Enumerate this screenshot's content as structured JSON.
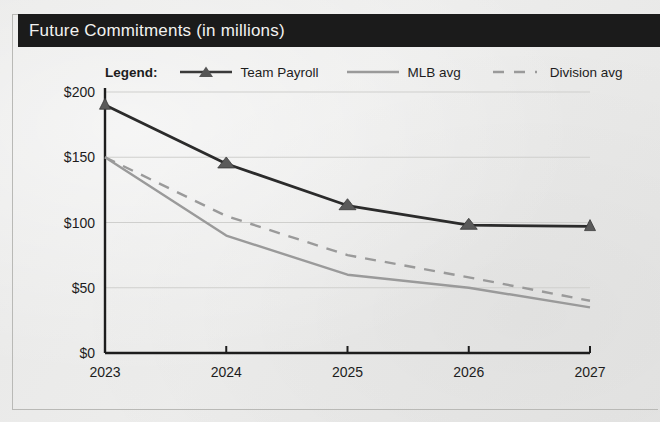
{
  "figure": {
    "title": "Future Commitments (in millions)",
    "title_bar_color": "#1b1b1b",
    "background_color": "#ececeb"
  },
  "legend": {
    "title": "Legend:",
    "entries": [
      {
        "label": "Team Payroll",
        "style": "line-with-triangle-marker",
        "color": "#2b2b2b"
      },
      {
        "label": "MLB avg",
        "style": "solid-line",
        "color": "#9a9a9a"
      },
      {
        "label": "Division avg",
        "style": "dashed-line",
        "color": "#9a9a9a"
      }
    ]
  },
  "axes": {
    "y_tick_labels": [
      "$0",
      "$50",
      "$100",
      "$150",
      "$200"
    ],
    "x_tick_labels": [
      "2023",
      "2024",
      "2025",
      "2026",
      "2027"
    ]
  },
  "chart_data": {
    "type": "line",
    "title": "Future Commitments (in millions)",
    "xlabel": "",
    "ylabel": "",
    "categories": [
      "2023",
      "2024",
      "2025",
      "2026",
      "2027"
    ],
    "x": [
      2023,
      2024,
      2025,
      2026,
      2027
    ],
    "ylim": [
      0,
      200
    ],
    "yticks": [
      0,
      50,
      100,
      150,
      200
    ],
    "ytick_labels": [
      "$0",
      "$50",
      "$100",
      "$150",
      "$200"
    ],
    "grid": "horizontal",
    "legend_position": "top",
    "series": [
      {
        "name": "Team Payroll",
        "values": [
          190,
          145,
          113,
          98,
          97
        ],
        "color": "#2b2b2b",
        "line_style": "solid",
        "marker": "triangle"
      },
      {
        "name": "MLB avg",
        "values": [
          150,
          90,
          60,
          50,
          35
        ],
        "color": "#9a9a9a",
        "line_style": "solid",
        "marker": "none"
      },
      {
        "name": "Division avg",
        "values": [
          150,
          105,
          75,
          58,
          40
        ],
        "color": "#9a9a9a",
        "line_style": "dashed",
        "marker": "none"
      }
    ]
  }
}
